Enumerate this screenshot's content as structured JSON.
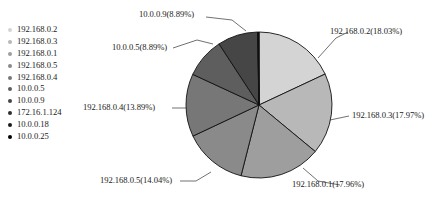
{
  "chart_data": {
    "type": "pie",
    "title": "",
    "legend_position": "left",
    "grid": false,
    "labels": [
      "192.168.0.2",
      "192.168.0.3",
      "192.168.0.1",
      "192.168.0.5",
      "192.168.0.4",
      "10.0.0.5",
      "10.0.0.9",
      "172.16.1.124",
      "10.0.0.18",
      "10.0.0.25"
    ],
    "values": [
      18.03,
      17.97,
      17.96,
      14.04,
      13.89,
      8.89,
      8.89,
      0.14,
      0.11,
      0.08
    ],
    "value_unit": "%",
    "colors": [
      "#d4d4d4",
      "#b8b8b8",
      "#9e9e9e",
      "#8a8a8a",
      "#777777",
      "#5e5e5e",
      "#464646",
      "#2e2e2e",
      "#1a1a1a",
      "#000000"
    ],
    "slice_labels": [
      "192.168.0.2(18.03%)",
      "192.168.0.3(17.97%)",
      "192.168.0.1(17.96%)",
      "192.168.0.5(14.04%)",
      "192.168.0.4(13.89%)",
      "10.0.0.5(8.89%)",
      "10.0.0.9(8.89%)"
    ]
  },
  "legend": {
    "items": [
      {
        "label": "192.168.0.2",
        "color": "#d4d4d4"
      },
      {
        "label": "192.168.0.3",
        "color": "#b8b8b8"
      },
      {
        "label": "192.168.0.1",
        "color": "#9e9e9e"
      },
      {
        "label": "192.168.0.5",
        "color": "#8a8a8a"
      },
      {
        "label": "192.168.0.4",
        "color": "#777777"
      },
      {
        "label": "10.0.0.5",
        "color": "#5e5e5e"
      },
      {
        "label": "10.0.0.9",
        "color": "#464646"
      },
      {
        "label": "172.16.1.124",
        "color": "#2e2e2e"
      },
      {
        "label": "10.0.0.18",
        "color": "#1a1a1a"
      },
      {
        "label": "10.0.0.25",
        "color": "#000000"
      }
    ]
  },
  "callouts": {
    "top": "10.0.0.9(8.89%)",
    "upper_left": "10.0.0.5(8.89%)",
    "left": "192.168.0.4(13.89%)",
    "bottom_left": "192.168.0.5(14.04%)",
    "bottom_right": "192.168.0.1(17.96%)",
    "right": "192.168.0.3(17.97%)",
    "upper_right": "192.168.0.2(18.03%)"
  }
}
